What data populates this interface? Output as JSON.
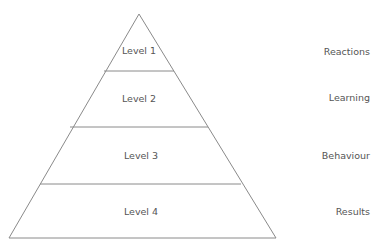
{
  "diagram": {
    "type": "pyramid",
    "levels": [
      {
        "label": "Level 1",
        "outcome": "Reactions"
      },
      {
        "label": "Level 2",
        "outcome": "Learning"
      },
      {
        "label": "Level 3",
        "outcome": "Behaviour"
      },
      {
        "label": "Level 4",
        "outcome": "Results"
      }
    ],
    "colors": {
      "line": "#8a8a8a",
      "text": "#555555",
      "background": "#ffffff"
    }
  }
}
